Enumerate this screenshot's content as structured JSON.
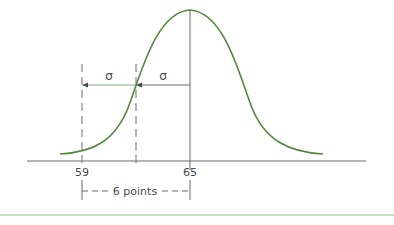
{
  "diagram": {
    "type": "normal-distribution",
    "curve_color": "#4f8a3c",
    "line_color": "#6a6a6a",
    "accent_line_color": "#7fb07a",
    "labels": {
      "sigma_left": "σ",
      "sigma_right": "σ",
      "tick_left": "59",
      "tick_mean": "65",
      "distance": "6 points"
    }
  }
}
